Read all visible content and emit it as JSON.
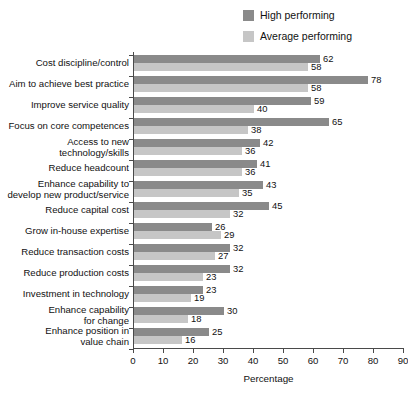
{
  "chart_data": {
    "type": "bar",
    "orientation": "horizontal",
    "title": "",
    "subtitle": "",
    "xlabel": "Percentage",
    "ylabel": "",
    "xlim": [
      0,
      90
    ],
    "xticks": [
      0,
      10,
      20,
      30,
      40,
      50,
      60,
      70,
      80,
      90
    ],
    "grid": false,
    "legend_position": "top-right",
    "categories": [
      "Cost discipline/control",
      "Aim to achieve best practice",
      "Improve service quality",
      "Focus on core competences",
      "Access to new\ntechnology/skills",
      "Reduce headcount",
      "Enhance capability to\ndevelop new product/service",
      "Reduce capital cost",
      "Grow in-house expertise",
      "Reduce transaction costs",
      "Reduce production costs",
      "Investment in technology",
      "Enhance capability\nfor change",
      "Enhance position in\nvalue chain"
    ],
    "series": [
      {
        "name": "High performing",
        "color": "#8a8a8a",
        "values": [
          62,
          78,
          59,
          65,
          42,
          41,
          43,
          45,
          26,
          32,
          32,
          23,
          30,
          25
        ]
      },
      {
        "name": "Average performing",
        "color": "#c6c6c6",
        "values": [
          58,
          58,
          40,
          38,
          36,
          36,
          35,
          32,
          29,
          27,
          23,
          19,
          18,
          16
        ]
      }
    ]
  },
  "legend": {
    "items": [
      {
        "label": "High performing",
        "color": "#8a8a8a"
      },
      {
        "label": "Average performing",
        "color": "#c6c6c6"
      }
    ]
  },
  "axis": {
    "x_title": "Percentage"
  }
}
